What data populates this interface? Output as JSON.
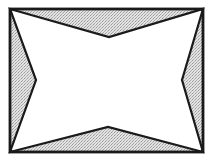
{
  "diagram": {
    "width": 212,
    "height": 159,
    "colors": {
      "background": "#ffffff",
      "stroke": "#1a1a1a",
      "shade": "#d4d4d4",
      "center": "#ffffff"
    },
    "rectangle": {
      "x1": 10,
      "y1": 9,
      "x2": 203,
      "y2": 152
    },
    "inner_vertices": {
      "top": {
        "x": 109,
        "y": 37
      },
      "right": {
        "x": 182,
        "y": 80
      },
      "bottom": {
        "x": 108,
        "y": 127
      },
      "left": {
        "x": 36,
        "y": 80
      }
    },
    "stroke_width": 2.2
  }
}
